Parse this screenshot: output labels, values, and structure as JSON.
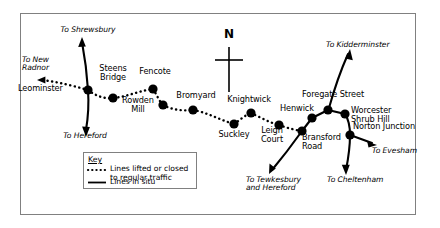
{
  "figure": {
    "type": "railway-route-map",
    "region": "Worcester and Herefordshire railway lines",
    "border_color": "#7a7a7a",
    "ink_color": "#000000",
    "background": "#ffffff"
  },
  "compass": {
    "letter": "N",
    "name": "north-arrow"
  },
  "stations": [
    {
      "name": "Leominster",
      "label": "Leominster",
      "x": 88,
      "y": 90,
      "label_x": 85,
      "label_y": 86,
      "align": "right"
    },
    {
      "name": "Steens Bridge",
      "label": "Steens\nBridge",
      "x": 113,
      "y": 98,
      "label_x": 113,
      "label_y": 69,
      "align": "center"
    },
    {
      "name": "Fencote",
      "label": "Fencote",
      "x": 153,
      "y": 89,
      "label_x": 153,
      "label_y": 72,
      "align": "center"
    },
    {
      "name": "Rowden Mill",
      "label": "Rowden\nMill",
      "x": 163,
      "y": 105,
      "label_x": 160,
      "label_y": 100,
      "align": "right"
    },
    {
      "name": "Bromyard",
      "label": "Bromyard",
      "x": 193,
      "y": 110,
      "label_x": 196,
      "label_y": 95,
      "align": "center"
    },
    {
      "name": "Suckley",
      "label": "Suckley",
      "x": 234,
      "y": 124,
      "label_x": 234,
      "label_y": 127,
      "align": "center"
    },
    {
      "name": "Knightwick",
      "label": "Knightwick",
      "x": 251,
      "y": 113,
      "label_x": 249,
      "label_y": 98,
      "align": "center"
    },
    {
      "name": "Leigh Court",
      "label": "Leigh\nCourt",
      "x": 279,
      "y": 125,
      "label_x": 274,
      "label_y": 122,
      "align": "center"
    },
    {
      "name": "Henwick",
      "label": "Henwick",
      "x": 312,
      "y": 118,
      "label_x": 310,
      "label_y": 107,
      "align": "right"
    },
    {
      "name": "Foregate Street",
      "label": "Foregate Street",
      "x": 328,
      "y": 110,
      "label_x": 332,
      "label_y": 93,
      "align": "center"
    },
    {
      "name": "Worcester Shrub Hill",
      "label": "Worcester\nShrub Hill",
      "x": 345,
      "y": 114,
      "label_x": 352,
      "label_y": 107,
      "align": "left"
    },
    {
      "name": "Bransford Road",
      "label": "Bransford\nRoad",
      "x": 302,
      "y": 131,
      "label_x": 305,
      "label_y": 128,
      "align": "left"
    },
    {
      "name": "Norton Junction",
      "label": "Norton Junction",
      "x": 350,
      "y": 135,
      "label_x": 355,
      "label_y": 120,
      "align": "left"
    }
  ],
  "direction_labels": [
    {
      "name": "to-shrewsbury",
      "text": "To Shrewsbury",
      "x": 88,
      "y": 29,
      "align": "center"
    },
    {
      "name": "to-new-radnor",
      "text": "To New\nRadnor",
      "x": 22,
      "y": 58,
      "align": "left"
    },
    {
      "name": "to-hereford",
      "text": "To Hereford",
      "x": 85,
      "y": 135,
      "align": "center"
    },
    {
      "name": "to-kidderminster",
      "text": "To Kidderminster",
      "x": 330,
      "y": 43,
      "align": "left"
    },
    {
      "name": "to-evesham",
      "text": "To Evesham",
      "x": 375,
      "y": 150,
      "align": "left"
    },
    {
      "name": "to-cheltenham",
      "text": "To Cheltenham",
      "x": 330,
      "y": 180,
      "align": "left"
    },
    {
      "name": "to-tewkesbury-and-hereford",
      "text": "To Tewkesbury\nand Hereford",
      "x": 248,
      "y": 180,
      "align": "left"
    }
  ],
  "key": {
    "title": "Key",
    "entries": [
      {
        "style": "dotted",
        "text": "Lines lifted or closed\nto regular traffic"
      },
      {
        "style": "solid",
        "text": "Lines in situ"
      }
    ]
  }
}
